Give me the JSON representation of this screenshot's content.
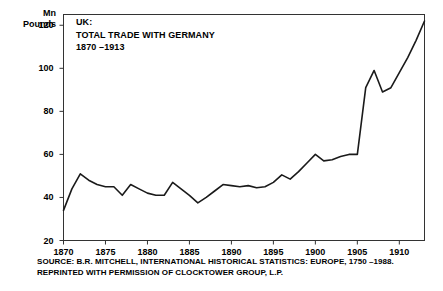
{
  "chart_data": {
    "type": "line",
    "title_lines": [
      "UK:",
      "TOTAL TRADE WITH GERMANY",
      "1870 –1913"
    ],
    "xlabel": "",
    "ylabel": "Mn Pounds",
    "ylabel_lines": [
      "Mn",
      "Pounds"
    ],
    "xlim": [
      1870,
      1913
    ],
    "ylim": [
      20,
      125
    ],
    "grid": false,
    "legend": null,
    "y_ticks": [
      120,
      100,
      80,
      60,
      40,
      20
    ],
    "y_tick_labels": [
      "120",
      "100",
      "80",
      "60",
      "40",
      "20"
    ],
    "x_ticks": [
      1870,
      1875,
      1880,
      1885,
      1890,
      1895,
      1900,
      1905,
      1910
    ],
    "x_tick_labels": [
      "1870",
      "1875",
      "1880",
      "1885",
      "1890",
      "1895",
      "1900",
      "1905",
      "1910"
    ],
    "line_color": "#1a1a1a",
    "x": [
      1870,
      1871,
      1872,
      1873,
      1874,
      1875,
      1876,
      1877,
      1878,
      1879,
      1880,
      1881,
      1882,
      1883,
      1884,
      1885,
      1886,
      1887,
      1888,
      1889,
      1890,
      1891,
      1892,
      1893,
      1894,
      1895,
      1896,
      1897,
      1898,
      1899,
      1900,
      1901,
      1902,
      1903,
      1904,
      1905,
      1906,
      1907,
      1908,
      1909,
      1910,
      1911,
      1912,
      1913
    ],
    "values": [
      34,
      44,
      51,
      48,
      46,
      45,
      45,
      41,
      46,
      44,
      42,
      41,
      41,
      47,
      44,
      41,
      37.5,
      40,
      43,
      46,
      45.5,
      45,
      45.5,
      44.5,
      45,
      47,
      50.5,
      48.5,
      52,
      56,
      60,
      57,
      57.5,
      59,
      60,
      60,
      91,
      99,
      89,
      91,
      98,
      105,
      113,
      122
    ],
    "series": [
      {
        "name": "UK total trade with Germany",
        "unit": "Mn Pounds",
        "values": [
          34,
          44,
          51,
          48,
          46,
          45,
          45,
          41,
          46,
          44,
          42,
          41,
          41,
          47,
          44,
          41,
          37.5,
          40,
          43,
          46,
          45.5,
          45,
          45.5,
          44.5,
          45,
          47,
          50.5,
          48.5,
          52,
          56,
          60,
          57,
          57.5,
          59,
          60,
          60,
          91,
          99,
          89,
          91,
          98,
          105,
          113,
          122
        ]
      }
    ],
    "annotations": []
  },
  "source": {
    "line1": "SOURCE: B.R. MITCHELL, INTERNATIONAL HISTORICAL STATISTICS: EUROPE, 1750 –1988.",
    "line2": "REPRINTED WITH PERMISSION OF CLOCKTOWER GROUP, L.P."
  }
}
